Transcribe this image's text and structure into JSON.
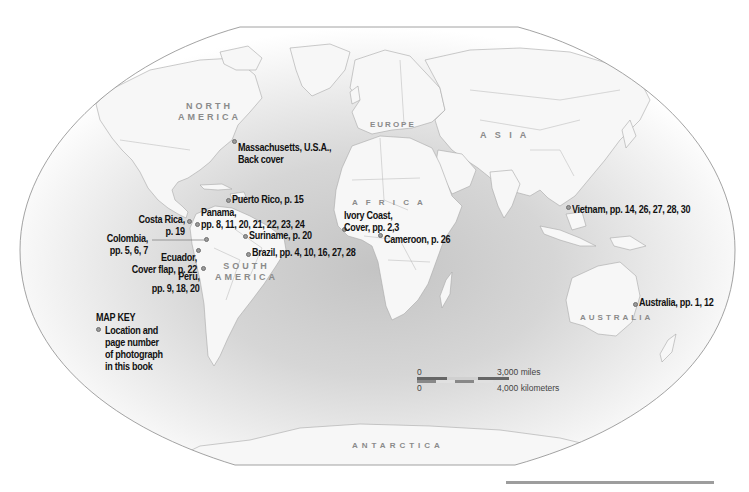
{
  "map": {
    "projection": "world-winkel-style",
    "colors": {
      "ocean_center": "#c6c6c6",
      "ocean_edge": "#ffffff",
      "land": "#f7f7f7",
      "border": "#a8a8a8",
      "frame": "#8c8c8c",
      "marker": "#9a9a9a",
      "label_text": "#111111",
      "region_text": "#8a8a8a"
    },
    "regions": [
      {
        "id": "north-america",
        "line1": "NORTH",
        "line2": "AMERICA"
      },
      {
        "id": "europe",
        "line1": "EUROPE"
      },
      {
        "id": "asia",
        "line1": "A  S  I  A"
      },
      {
        "id": "africa",
        "line1": "A  F  R  I  C  A"
      },
      {
        "id": "south-america",
        "line1": "SOUTH",
        "line2": "AMERICA"
      },
      {
        "id": "australia",
        "line1": "AUSTRALIA"
      },
      {
        "id": "antarctica",
        "line1": "ANTARCTICA"
      }
    ],
    "locations": [
      {
        "id": "massachusetts",
        "line1": "Massachusetts, U.S.A.,",
        "line2": "Back cover"
      },
      {
        "id": "puerto-rico",
        "line1": "Puerto Rico, p. 15"
      },
      {
        "id": "panama",
        "line1": "Panama,",
        "line2": "pp. 8, 11, 20, 21, 22, 23, 24"
      },
      {
        "id": "costa-rica",
        "line1": "Costa Rica,",
        "line2": "p. 19"
      },
      {
        "id": "colombia",
        "line1": "Colombia,",
        "line2": "pp. 5, 6, 7"
      },
      {
        "id": "suriname",
        "line1": "Suriname, p. 20"
      },
      {
        "id": "ecuador",
        "line1": "Ecuador,",
        "line2": "Cover flap, p. 22"
      },
      {
        "id": "brazil",
        "line1": "Brazil, pp. 4, 10, 16, 27, 28"
      },
      {
        "id": "peru",
        "line1": "Peru,",
        "line2": "pp. 9, 18, 20"
      },
      {
        "id": "ivory-coast",
        "line1": "Ivory Coast,",
        "line2": "Cover, pp. 2,3"
      },
      {
        "id": "cameroon",
        "line1": "Cameroon, p. 26"
      },
      {
        "id": "vietnam",
        "line1": "Vietnam, pp. 14, 26, 27, 28, 30"
      },
      {
        "id": "australia",
        "line1": "Australia, pp. 1, 12"
      }
    ],
    "key": {
      "title": "MAP KEY",
      "desc_lines": [
        "Location and",
        "page number",
        "of photograph",
        "in this book"
      ]
    },
    "scale": {
      "miles_zero": "0",
      "miles_value": "3,000  miles",
      "km_zero": "0",
      "km_value": "4,000  kilometers"
    }
  }
}
